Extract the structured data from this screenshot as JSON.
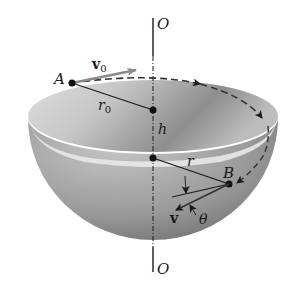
{
  "figure": {
    "labels": {
      "axis_top": "O",
      "axis_bottom": "O",
      "point_a": "A",
      "point_b": "B",
      "initial_velocity": "v",
      "initial_velocity_sub": "0",
      "initial_radius": "r",
      "initial_radius_sub": "0",
      "height": "h",
      "radius": "r",
      "velocity": "v",
      "angle": "θ"
    },
    "colors": {
      "line": "#1a1a1a",
      "bowl_inner_light": "#e6e6e6",
      "bowl_inner_dark": "#8c8c8c",
      "bowl_outer_light": "#bdbdbd",
      "bowl_outer_dark": "#6e6e6e",
      "arrow_v0": "#9a9a9a"
    }
  }
}
